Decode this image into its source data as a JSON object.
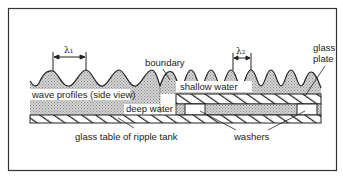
{
  "diagram": {
    "labels": {
      "lambda1": "λ₁",
      "lambda2": "λ₂",
      "boundary": "boundary",
      "glass_plate_line1": "glass",
      "glass_plate_line2": "plate",
      "wave_profiles": "wave profiles (side view)",
      "shallow_water": "shallow water",
      "deep_water": "deep water",
      "glass_table": "glass table of ripple tank",
      "washers": "washers"
    },
    "colors": {
      "frame": "#333333",
      "line": "#222222",
      "water_fill": "#bdbdbd",
      "background": "#ffffff"
    }
  }
}
